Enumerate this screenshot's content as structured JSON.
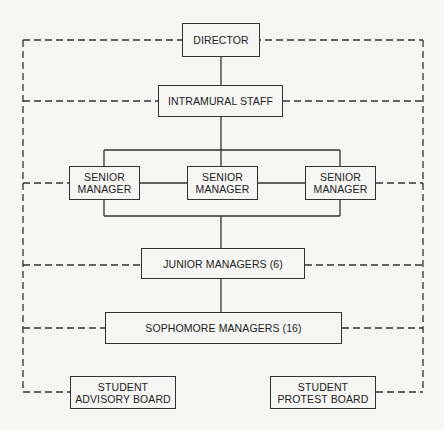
{
  "diagram": {
    "type": "organizational-chart",
    "nodes": {
      "director": {
        "label": "DIRECTOR"
      },
      "intramural_staff": {
        "label": "INTRAMURAL STAFF"
      },
      "senior_managers": [
        {
          "line1": "SENIOR",
          "line2": "MANAGER"
        },
        {
          "line1": "SENIOR",
          "line2": "MANAGER"
        },
        {
          "line1": "SENIOR",
          "line2": "MANAGER"
        }
      ],
      "junior_managers": {
        "label": "JUNIOR MANAGERS (6)"
      },
      "sophomore_managers": {
        "label": "SOPHOMORE MANAGERS (16)"
      },
      "student_advisory_board": {
        "line1": "STUDENT",
        "line2": "ADVISORY BOARD"
      },
      "student_protest_board": {
        "line1": "STUDENT",
        "line2": "PROTEST BOARD"
      }
    },
    "edges": [
      {
        "from": "DIRECTOR",
        "to": "INTRAMURAL STAFF",
        "style": "solid"
      },
      {
        "from": "INTRAMURAL STAFF",
        "to": "SENIOR MANAGER (all 3)",
        "style": "solid"
      },
      {
        "from": "SENIOR MANAGER (all 3)",
        "to": "JUNIOR MANAGERS (6)",
        "style": "solid"
      },
      {
        "from": "JUNIOR MANAGERS (6)",
        "to": "SOPHOMORE MANAGERS (16)",
        "style": "solid"
      },
      {
        "from": "all levels",
        "to": "STUDENT ADVISORY BOARD",
        "style": "dashed"
      },
      {
        "from": "all levels",
        "to": "STUDENT PROTEST BOARD",
        "style": "dashed"
      }
    ],
    "colors": {
      "line": "#333333",
      "background": "#f6f6f4",
      "text": "#222222"
    }
  }
}
